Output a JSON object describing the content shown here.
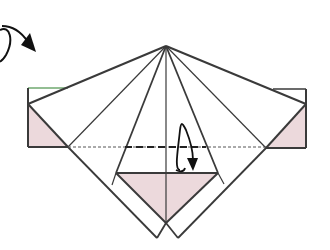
{
  "diagram": {
    "colors": {
      "line": "#3a3a3a",
      "pink_fill": "#ecd9dc",
      "background": "#ffffff",
      "green_edge": "#6fa86f"
    },
    "symbols": [
      {
        "name": "turn-over-arrow",
        "meaning": "turn model over"
      },
      {
        "name": "valley-fold-line",
        "meaning": "fold along dashed line"
      },
      {
        "name": "fold-up-arrow",
        "meaning": "fold flap up"
      }
    ]
  }
}
